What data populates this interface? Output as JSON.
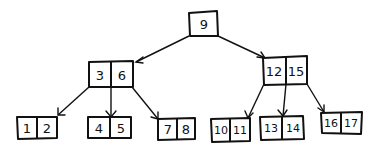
{
  "diagram": {
    "type": "b-tree",
    "root": {
      "keys": [
        "9"
      ]
    },
    "internal": [
      {
        "keys": [
          "3",
          "6"
        ]
      },
      {
        "keys": [
          "12",
          "15"
        ]
      }
    ],
    "leaves": [
      {
        "keys": [
          "1",
          "2"
        ]
      },
      {
        "keys": [
          "4",
          "5"
        ]
      },
      {
        "keys": [
          "7",
          "8"
        ]
      },
      {
        "keys": [
          "10",
          "11"
        ]
      },
      {
        "keys": [
          "13",
          "14"
        ]
      },
      {
        "keys": [
          "16",
          "17"
        ]
      }
    ],
    "edges": [
      {
        "from": "9",
        "to": "3|6"
      },
      {
        "from": "9",
        "to": "12|15"
      },
      {
        "from": "3|6",
        "to": "1|2"
      },
      {
        "from": "3|6",
        "to": "4|5"
      },
      {
        "from": "3|6",
        "to": "7|8"
      },
      {
        "from": "12|15",
        "to": "10|11"
      },
      {
        "from": "12|15",
        "to": "13|14"
      },
      {
        "from": "12|15",
        "to": "16|17"
      }
    ],
    "colors": {
      "stroke": "#111111",
      "background": "#ffffff"
    }
  }
}
